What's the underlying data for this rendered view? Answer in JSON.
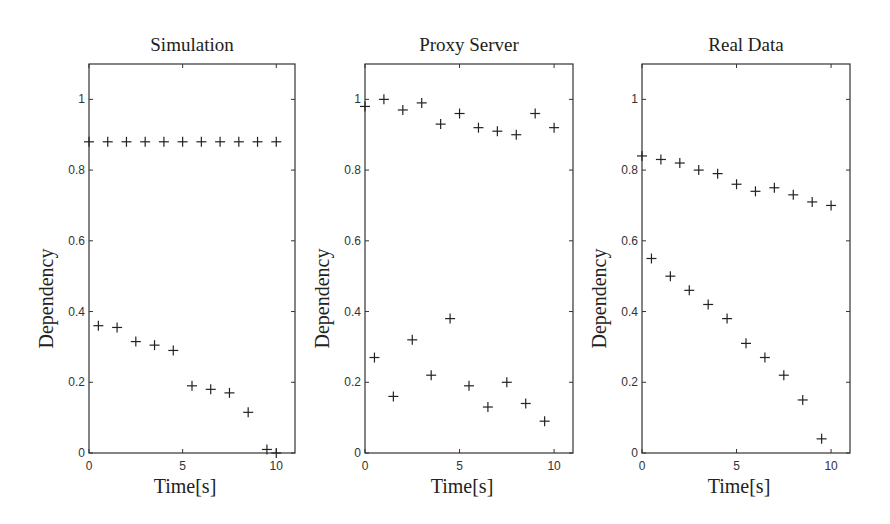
{
  "figure": {
    "marker": "plus",
    "marker_color": "#222222",
    "axes_color": "#333333",
    "background": "#ffffff"
  },
  "chart_data": [
    {
      "type": "scatter",
      "title": "Simulation",
      "xlabel": "Time[s]",
      "ylabel": "Dependency",
      "xlim": [
        0,
        11
      ],
      "ylim": [
        0,
        1.1
      ],
      "xticks": [
        0,
        5,
        10
      ],
      "yticks": [
        0,
        0.2,
        0.4,
        0.6,
        0.8,
        1
      ],
      "ytick_labels": [
        "0",
        "0.2",
        "0.4",
        "0.6",
        "0.8",
        "1"
      ],
      "xtick_labels": [
        "0",
        "5",
        "10"
      ],
      "grid": false,
      "series": [
        {
          "name": "upper",
          "x": [
            0,
            1,
            2,
            3,
            4,
            5,
            6,
            7,
            8,
            9,
            10
          ],
          "y": [
            0.88,
            0.88,
            0.88,
            0.88,
            0.88,
            0.88,
            0.88,
            0.88,
            0.88,
            0.88,
            0.88
          ]
        },
        {
          "name": "lower",
          "x": [
            0.5,
            1.5,
            2.5,
            3.5,
            4.5,
            5.5,
            6.5,
            7.5,
            8.5,
            9.5,
            10
          ],
          "y": [
            0.36,
            0.355,
            0.315,
            0.305,
            0.29,
            0.19,
            0.18,
            0.17,
            0.115,
            0.01,
            0.0
          ]
        }
      ]
    },
    {
      "type": "scatter",
      "title": "Proxy Server",
      "xlabel": "Time[s]",
      "ylabel": "Dependency",
      "xlim": [
        0,
        11
      ],
      "ylim": [
        0,
        1.1
      ],
      "xticks": [
        0,
        5,
        10
      ],
      "yticks": [
        0,
        0.2,
        0.4,
        0.6,
        0.8,
        1
      ],
      "ytick_labels": [
        "0",
        "0.2",
        "0.4",
        "0.6",
        "0.8",
        "1"
      ],
      "xtick_labels": [
        "0",
        "5",
        "10"
      ],
      "grid": false,
      "series": [
        {
          "name": "upper",
          "x": [
            0,
            1,
            2,
            3,
            4,
            5,
            6,
            7,
            8,
            9,
            10
          ],
          "y": [
            0.98,
            1.0,
            0.97,
            0.99,
            0.93,
            0.96,
            0.92,
            0.91,
            0.9,
            0.96,
            0.92
          ]
        },
        {
          "name": "lower",
          "x": [
            0.5,
            1.5,
            2.5,
            3.5,
            4.5,
            5.5,
            6.5,
            7.5,
            8.5,
            9.5
          ],
          "y": [
            0.27,
            0.16,
            0.32,
            0.22,
            0.38,
            0.19,
            0.13,
            0.2,
            0.14,
            0.09
          ]
        }
      ]
    },
    {
      "type": "scatter",
      "title": "Real Data",
      "xlabel": "Time[s]",
      "ylabel": "Dependency",
      "xlim": [
        0,
        11
      ],
      "ylim": [
        0,
        1.1
      ],
      "xticks": [
        0,
        5,
        10
      ],
      "yticks": [
        0,
        0.2,
        0.4,
        0.6,
        0.8,
        1
      ],
      "ytick_labels": [
        "0",
        "0.2",
        "0.4",
        "0.6",
        "0.8",
        "1"
      ],
      "xtick_labels": [
        "0",
        "5",
        "10"
      ],
      "grid": false,
      "series": [
        {
          "name": "upper",
          "x": [
            0,
            1,
            2,
            3,
            4,
            5,
            6,
            7,
            8,
            9,
            10
          ],
          "y": [
            0.84,
            0.83,
            0.82,
            0.8,
            0.79,
            0.76,
            0.74,
            0.75,
            0.73,
            0.71,
            0.7
          ]
        },
        {
          "name": "lower",
          "x": [
            0.5,
            1.5,
            2.5,
            3.5,
            4.5,
            5.5,
            6.5,
            7.5,
            8.5,
            9.5
          ],
          "y": [
            0.55,
            0.5,
            0.46,
            0.42,
            0.38,
            0.31,
            0.27,
            0.22,
            0.15,
            0.04
          ]
        }
      ]
    }
  ]
}
